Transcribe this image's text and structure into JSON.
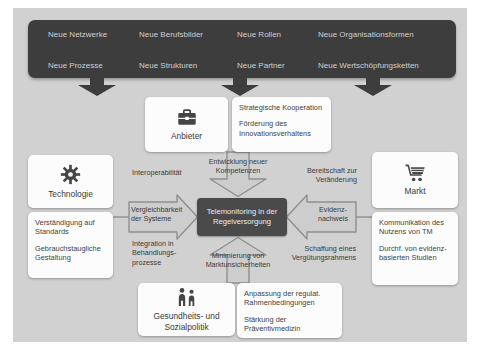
{
  "colors": {
    "panel_bg": "#d1d1d1",
    "band_bg": "#3d3d3d",
    "center_bg": "#4a4a4a",
    "box_bg": "#fcfcfc",
    "arrow_fill": "#cdcdcd",
    "arrow_stroke": "#8f8f8f",
    "text_dark": "#3a3a3a",
    "text_light": "#cfcfcf"
  },
  "banner": {
    "columns": [
      {
        "top": "Neue Netzwerke",
        "bottom": "Neue Prozesse"
      },
      {
        "top": "Neue Berufsbilder",
        "bottom": "Neue Strukturen"
      },
      {
        "top": "Neue Rollen",
        "bottom": "Neue Partner"
      },
      {
        "top": "Neue Organisationsformen",
        "bottom": "Neue Wertschöpfungsketten"
      }
    ]
  },
  "center": {
    "label": "Telemonitoring in der Regelversorgung"
  },
  "stakeholders": {
    "anbieter": {
      "label": "Anbieter",
      "icon": "briefcase-icon"
    },
    "technologie": {
      "label": "Technologie",
      "icon": "gear-icon"
    },
    "markt": {
      "label": "Markt",
      "icon": "cart-icon"
    },
    "politik": {
      "label": "Gesundheits- und Sozialpolitik",
      "icon": "people-icon"
    }
  },
  "factors": {
    "anbieter": {
      "item1": "Strategische Kooperation",
      "item2": "Förderung des Innovationsverhaltens"
    },
    "technologie": {
      "item1": "Verständigung auf Standards",
      "item2": "Gebrauchstaugliche Gestaltung"
    },
    "markt": {
      "item1": "Kommunikation des Nutzens von TM",
      "item2": "Durchf. von evidenz-basierten Studien"
    },
    "politik": {
      "item1": "Anpassung der regulat. Rahmenbedingungen",
      "item2": "Stärkung der Präventivmedizin"
    }
  },
  "arrows": {
    "top": "Entwicklung neuer Kompetenzen",
    "bottom": "Minimierung von Marktunsicherheiten",
    "left": "Vergleichbarkeit der Systeme",
    "right": "Evidenz-nachweis"
  },
  "side_labels": {
    "left_top": "Interoperabilität",
    "left_bottom": "Integration in Behandlungs-prozesse",
    "right_top": "Bereitschaft zur Veränderung",
    "right_bottom": "Schaffung eines Vergütungsrahmens"
  }
}
